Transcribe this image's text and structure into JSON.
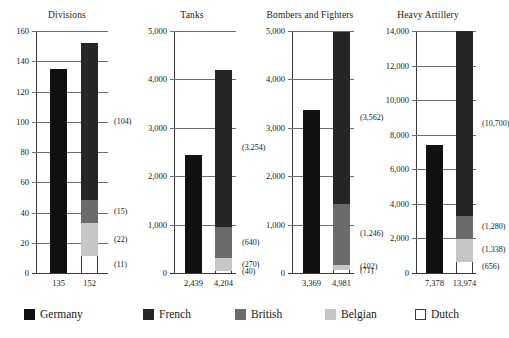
{
  "chart_data": {
    "type": "bar",
    "title": "",
    "subtitle": "",
    "layout": "four side-by-side stacked-bar panels; Germany single solid bar vs. Allied stacked bar",
    "grid": true,
    "legend_position": "bottom",
    "legend": [
      {
        "name": "Germany",
        "color": "#111111",
        "style": "solid-black"
      },
      {
        "name": "French",
        "color": "#262626",
        "style": "solid-dark"
      },
      {
        "name": "British",
        "color": "#6b6b6b",
        "style": "medium-gray"
      },
      {
        "name": "Belgian",
        "color": "#c6c6c6",
        "style": "light-gray"
      },
      {
        "name": "Dutch",
        "color": "#ffffff",
        "style": "white-outline"
      }
    ],
    "series": [
      {
        "name": "Germany",
        "values": [
          135,
          2439,
          3369,
          7378
        ]
      },
      {
        "name": "French",
        "values": [
          104,
          3254,
          3562,
          10700
        ]
      },
      {
        "name": "British",
        "values": [
          15,
          640,
          1246,
          1280
        ]
      },
      {
        "name": "Belgian",
        "values": [
          22,
          270,
          102,
          1338
        ]
      },
      {
        "name": "Dutch",
        "values": [
          11,
          40,
          71,
          656
        ]
      }
    ],
    "panels": [
      {
        "title": "Divisions",
        "ylim": [
          0,
          160
        ],
        "yticks": [
          0,
          20,
          40,
          60,
          80,
          100,
          120,
          140,
          160
        ],
        "ytick_labels": [
          "0",
          "20",
          "40",
          "60",
          "80",
          "100",
          "120",
          "140",
          "160"
        ],
        "german_total": 135,
        "german_total_label": "135",
        "allied_total": 152,
        "allied_total_label": "152",
        "stack": [
          {
            "name": "Dutch",
            "value": 11,
            "label": "(11)"
          },
          {
            "name": "Belgian",
            "value": 22,
            "label": "(22)"
          },
          {
            "name": "British",
            "value": 15,
            "label": "(15)"
          },
          {
            "name": "French",
            "value": 104,
            "label": "(104)"
          }
        ]
      },
      {
        "title": "Tanks",
        "ylim": [
          0,
          5000
        ],
        "yticks": [
          0,
          1000,
          2000,
          3000,
          4000,
          5000
        ],
        "ytick_labels": [
          "0",
          "1,000",
          "2,000",
          "3,000",
          "4,000",
          "5,000"
        ],
        "german_total": 2439,
        "german_total_label": "2,439",
        "allied_total": 4204,
        "allied_total_label": "4,204",
        "stack": [
          {
            "name": "Dutch",
            "value": 40,
            "label": "(40)"
          },
          {
            "name": "Belgian",
            "value": 270,
            "label": "(270)"
          },
          {
            "name": "British",
            "value": 640,
            "label": "(640)"
          },
          {
            "name": "French",
            "value": 3254,
            "label": "(3,254)"
          }
        ]
      },
      {
        "title": "Bombers and Fighters",
        "ylim": [
          0,
          5000
        ],
        "yticks": [
          0,
          1000,
          2000,
          3000,
          4000,
          5000
        ],
        "ytick_labels": [
          "0",
          "1,000",
          "2,000",
          "3,000",
          "4,000",
          "5,000"
        ],
        "german_total": 3369,
        "german_total_label": "3,369",
        "allied_total": 4981,
        "allied_total_label": "4,981",
        "stack": [
          {
            "name": "Dutch",
            "value": 71,
            "label": "(71)"
          },
          {
            "name": "Belgian",
            "value": 102,
            "label": "(102)"
          },
          {
            "name": "British",
            "value": 1246,
            "label": "(1,246)"
          },
          {
            "name": "French",
            "value": 3562,
            "label": "(3,562)"
          }
        ]
      },
      {
        "title": "Heavy Artillery",
        "ylim": [
          0,
          14000
        ],
        "yticks": [
          0,
          2000,
          4000,
          6000,
          8000,
          10000,
          12000,
          14000
        ],
        "ytick_labels": [
          "0",
          "2,000",
          "4,000",
          "6,000",
          "8,000",
          "10,000",
          "12,000",
          "14,000"
        ],
        "german_total": 7378,
        "german_total_label": "7,378",
        "allied_total": 13974,
        "allied_total_label": "13,974",
        "stack": [
          {
            "name": "Dutch",
            "value": 656,
            "label": "(656)"
          },
          {
            "name": "Belgian",
            "value": 1338,
            "label": "(1,338)"
          },
          {
            "name": "British",
            "value": 1280,
            "label": "(1,280)"
          },
          {
            "name": "French",
            "value": 10700,
            "label": "(10,700)"
          }
        ]
      }
    ]
  }
}
